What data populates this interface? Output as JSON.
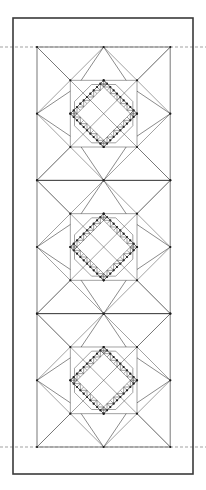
{
  "document": {
    "type": "quilt-block-drawing",
    "title": "Feathered Star Quilt Panel",
    "background_color": "#ffffff"
  },
  "canvas": {
    "width": 206,
    "height": 490
  },
  "frame": {
    "name": "outer-border",
    "x": 13,
    "y": 18,
    "width": 180,
    "height": 456,
    "stroke_color": "#3a3a3a",
    "stroke_width": 1.6,
    "fill": "#ffffff"
  },
  "guides": {
    "stroke_color": "#7a7a7a",
    "dash": "3,2",
    "stroke_width": 0.7,
    "lines": [
      {
        "name": "top-guide",
        "y": 47,
        "x1": 0,
        "x2": 206
      },
      {
        "name": "bottom-guide",
        "y": 447,
        "x1": 0,
        "x2": 206
      }
    ]
  },
  "pattern": {
    "name": "feathered-star-panel",
    "x": 37,
    "y": 47,
    "width": 133,
    "height": 400,
    "block_count": 3,
    "block_size": 133.33,
    "grid_divisions": 8,
    "stroke_color": "#555555",
    "stroke_width": 0.55,
    "accent_stroke_color": "#2b2b2b",
    "node_color": "#1a1a1a",
    "node_radius": 1.1,
    "panel_outline_color": "#8a8a8a",
    "blocks": [
      {
        "name": "star-block-top",
        "index": 0,
        "y_offset": 0
      },
      {
        "name": "star-block-middle",
        "index": 1,
        "y_offset": 133.33
      },
      {
        "name": "star-block-bottom",
        "index": 2,
        "y_offset": 266.66
      }
    ],
    "feather_teeth_per_edge": 5,
    "center_shape": "octagon"
  }
}
